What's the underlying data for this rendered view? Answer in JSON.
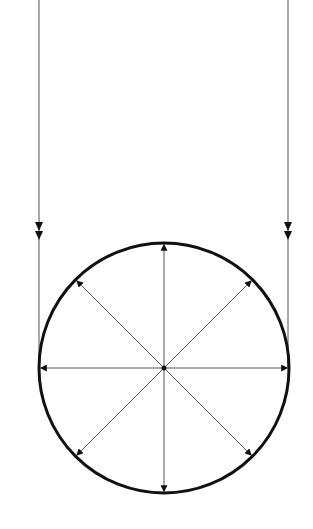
{
  "diagram": {
    "title": "",
    "colors": {
      "background": "#ffffff",
      "circle_stroke": "#111111",
      "line_stroke": "#555555",
      "arrow_fill": "#111111"
    },
    "circle": {
      "cx": 164,
      "cy": 368,
      "r": 125,
      "stroke_width": 3
    },
    "radial_arrows": {
      "count": 8,
      "angles_deg": [
        0,
        45,
        90,
        135,
        180,
        225,
        270,
        315
      ],
      "direction": "outward"
    },
    "tangent_lines": [
      {
        "name": "left",
        "x": 39,
        "y_start": 0,
        "y_end": 368,
        "double_arrow_y": [
          231,
          240
        ]
      },
      {
        "name": "right",
        "x": 288,
        "y_start": 0,
        "y_end": 368,
        "double_arrow_y": [
          231,
          240
        ]
      }
    ]
  }
}
